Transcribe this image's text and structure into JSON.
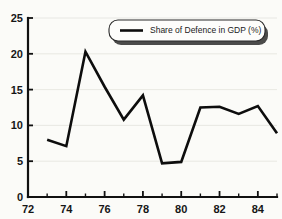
{
  "chart_data": {
    "type": "line",
    "title": "",
    "subtitle": "",
    "xlabel": "",
    "ylabel": "",
    "xlim": [
      72,
      85
    ],
    "ylim": [
      0,
      25
    ],
    "grid": true,
    "legend_position": "top-right",
    "x_ticks": [
      "72",
      "74",
      "76",
      "78",
      "80",
      "82",
      "84"
    ],
    "x_tick_values": [
      72,
      74,
      76,
      78,
      80,
      82,
      84
    ],
    "x_minor_tick_values": [
      73,
      75,
      77,
      79,
      81,
      83,
      85
    ],
    "y_ticks": [
      "0",
      "5",
      "10",
      "15",
      "20",
      "25"
    ],
    "y_tick_values": [
      0,
      5,
      10,
      15,
      20,
      25
    ],
    "x": [
      73,
      74,
      75,
      76,
      77,
      78,
      79,
      80,
      81,
      82,
      83,
      84,
      85
    ],
    "series": [
      {
        "name": "Share of Defence in GDP (%)",
        "color": "#0d0d0d",
        "values": [
          8.0,
          7.1,
          20.3,
          15.4,
          10.8,
          14.2,
          4.7,
          4.9,
          12.5,
          12.6,
          11.6,
          12.7,
          8.9
        ]
      }
    ],
    "annotations": []
  },
  "legend": {
    "entries": [
      {
        "label": "Share of Defence in GDP (%)",
        "color": "#0d0d0d",
        "marker": "line"
      }
    ]
  },
  "axes": {
    "y_axis_name": "value-axis",
    "x_axis_name": "year-axis"
  }
}
